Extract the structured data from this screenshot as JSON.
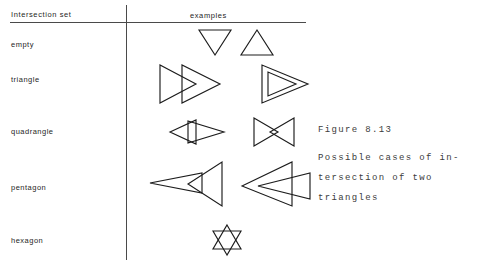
{
  "figure": {
    "table": {
      "headers": {
        "intersection_set": "Intersection  set",
        "examples": "examples"
      },
      "rows": [
        {
          "label": "empty",
          "examples": [
            {
              "name": "downward-triangle",
              "description": "triangle pointing down"
            },
            {
              "name": "upward-triangle",
              "description": "triangle pointing up, disjoint"
            }
          ]
        },
        {
          "label": "triangle",
          "examples": [
            {
              "name": "two-overlapping-right-triangles",
              "description": "two congruent right-pointing triangles offset horizontally"
            },
            {
              "name": "nested-triangles",
              "description": "small triangle contained in a larger triangle"
            }
          ]
        },
        {
          "label": "quadrangle",
          "examples": [
            {
              "name": "arrow-overlap-quadrangle",
              "description": "left-pointing triangle crossing a right-pointing triangle"
            },
            {
              "name": "bowtie-quadrangle",
              "description": "two triangles apex to apex forming a bowtie"
            }
          ]
        },
        {
          "label": "pentagon",
          "examples": [
            {
              "name": "narrow-wedge-into-triangle",
              "description": "narrow left-pointing wedge piercing a tall triangle"
            },
            {
              "name": "wedge-overlapping-triangle",
              "description": "wedge overlapping a right-pointing triangle"
            }
          ]
        },
        {
          "label": "hexagon",
          "examples": [
            {
              "name": "hexagram-star",
              "description": "two opposed equilateral triangles forming a six-pointed star"
            }
          ]
        }
      ]
    },
    "caption": {
      "title": "Figure 8.13",
      "lines": [
        "Possible cases of in-",
        "tersection of two",
        "triangles"
      ]
    },
    "colors": {
      "ink": "#1c1c1c",
      "rule": "#4a4a4a",
      "caption_ink": "#3c3c3c",
      "background": "#ffffff"
    }
  }
}
